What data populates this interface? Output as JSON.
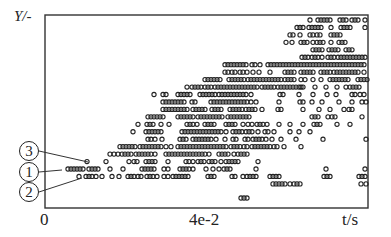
{
  "chart_data": {
    "type": "scatter",
    "title": "",
    "xlabel": "t/s",
    "ylabel": "Y/-",
    "x_ticks": [
      {
        "label": "0",
        "px": 45
      },
      {
        "label": "4e-2",
        "px": 205
      }
    ],
    "grid": false,
    "legend": [],
    "marker": "open-circle",
    "annotations": [
      {
        "label": "3",
        "symbol": "③",
        "cx": 29,
        "cy": 151,
        "to": [
          88,
          162
        ]
      },
      {
        "label": "1",
        "symbol": "①",
        "cx": 29,
        "cy": 172,
        "to": [
          62,
          170
        ]
      },
      {
        "label": "2",
        "symbol": "②",
        "cx": 29,
        "cy": 192,
        "to": [
          82,
          178
        ]
      }
    ],
    "frame": {
      "left": 45,
      "top": 15,
      "right": 368,
      "bottom": 208
    },
    "row_y0": 20,
    "row_dy": 7.45,
    "rows": [
      [
        310,
        318,
        321,
        324,
        327,
        330,
        340,
        343,
        346,
        352,
        355,
        358,
        365
      ],
      [
        297,
        300,
        303,
        309,
        312,
        315,
        318,
        321,
        331,
        341,
        344,
        347,
        350,
        365
      ],
      [
        290,
        293,
        300,
        310,
        313,
        317,
        320,
        331,
        334,
        337,
        340
      ],
      [
        286,
        292,
        301,
        304,
        307,
        313,
        317,
        320,
        323,
        331,
        339,
        342,
        345
      ],
      [
        313,
        316,
        319,
        322,
        329,
        332,
        335,
        338,
        346,
        349,
        352
      ],
      [
        302,
        305,
        308,
        312,
        315,
        318,
        322,
        328,
        331,
        334,
        338,
        341,
        344,
        347,
        350,
        353,
        356,
        359,
        362,
        365
      ],
      [
        225,
        228,
        231,
        234,
        237,
        240,
        243,
        246,
        252,
        255,
        260,
        268,
        271,
        274,
        277,
        280,
        283,
        286,
        289,
        292,
        295,
        298,
        301,
        304,
        307,
        310,
        313,
        316,
        319,
        322,
        325,
        328,
        331,
        334,
        337,
        340,
        343,
        346,
        349,
        352,
        355,
        358,
        361,
        364
      ],
      [
        225,
        228,
        232,
        235,
        240,
        243,
        247,
        253,
        259,
        270,
        285,
        288,
        291,
        294,
        301,
        304,
        307,
        310,
        313,
        321,
        324,
        327,
        330,
        334,
        337,
        340,
        343,
        346,
        349,
        352,
        355,
        358,
        364
      ],
      [
        205,
        208,
        211,
        214,
        217,
        220,
        229,
        232,
        235,
        238,
        241,
        244,
        248,
        251,
        254,
        257,
        260,
        263,
        266,
        269,
        272,
        275,
        278,
        281,
        285,
        288,
        291,
        294,
        301,
        305,
        313,
        321,
        330,
        333,
        336,
        339,
        342,
        345,
        348,
        358,
        361,
        364,
        367
      ],
      [
        187,
        192,
        195,
        198,
        201,
        205,
        208,
        211,
        215,
        218,
        221,
        224,
        227,
        230,
        233,
        236,
        239,
        242,
        245,
        248,
        251,
        254,
        257,
        262,
        265,
        268,
        271,
        274,
        278,
        281,
        284,
        287,
        290,
        293,
        296,
        299,
        301,
        303,
        315,
        326,
        337,
        346,
        350,
        353,
        356,
        359
      ],
      [
        154,
        163,
        166,
        178,
        181,
        184,
        187,
        190,
        200,
        203,
        206,
        209,
        212,
        215,
        219,
        222,
        225,
        228,
        231,
        234,
        237,
        240,
        243,
        246,
        251,
        280,
        283,
        299,
        313,
        327,
        336,
        352,
        355,
        360,
        364
      ],
      [
        163,
        166,
        169,
        172,
        175,
        178,
        181,
        184,
        192,
        195,
        211,
        214,
        217,
        220,
        223,
        226,
        229,
        232,
        235,
        238,
        241,
        244,
        247,
        251,
        256,
        279,
        300,
        303,
        312,
        322,
        339,
        352,
        362,
        366
      ],
      [
        163,
        166,
        169,
        172,
        175,
        178,
        181,
        184,
        187,
        193,
        196,
        199,
        202,
        205,
        212,
        215,
        218,
        221,
        230,
        233,
        236,
        239,
        242,
        246,
        249,
        252,
        255,
        262,
        278,
        281,
        303,
        319,
        330,
        344,
        349,
        352
      ],
      [
        148,
        151,
        154,
        157,
        160,
        163,
        178,
        181,
        184,
        187,
        190,
        193,
        198,
        201,
        204,
        207,
        210,
        213,
        216,
        219,
        222,
        228,
        231,
        234,
        237,
        240,
        243,
        246,
        249,
        312,
        315,
        318,
        328,
        332,
        335,
        362
      ],
      [
        138,
        147,
        150,
        153,
        161,
        169,
        187,
        190,
        193,
        197,
        205,
        208,
        211,
        214,
        226,
        229,
        232,
        235,
        243,
        248,
        252,
        257,
        260,
        263,
        267,
        279,
        290,
        303,
        314,
        317,
        320,
        337,
        350
      ],
      [
        133,
        146,
        149,
        152,
        155,
        158,
        161,
        182,
        185,
        188,
        191,
        194,
        197,
        200,
        203,
        206,
        209,
        212,
        215,
        218,
        221,
        226,
        233,
        236,
        239,
        242,
        246,
        249,
        252,
        258,
        265,
        268,
        274,
        290,
        299,
        310
      ],
      [
        148,
        151,
        155,
        162,
        180,
        183,
        186,
        193,
        196,
        199,
        202,
        205,
        208,
        211,
        216,
        225,
        233,
        236,
        245,
        248,
        253,
        256,
        259,
        262,
        266,
        272,
        281,
        296,
        323,
        366
      ],
      [
        120,
        123,
        126,
        129,
        132,
        135,
        140,
        143,
        146,
        149,
        152,
        155,
        158,
        161,
        166,
        171,
        178,
        181,
        184,
        187,
        190,
        193,
        196,
        199,
        202,
        205,
        208,
        211,
        214,
        217,
        220,
        223,
        226,
        231,
        234,
        237,
        240,
        244,
        247,
        252,
        255,
        258,
        261,
        264,
        267,
        270,
        274,
        277,
        284,
        301
      ],
      [
        110,
        114,
        118,
        122,
        125,
        128,
        131,
        136,
        139,
        142,
        145,
        148,
        151,
        155,
        166,
        169,
        172,
        175,
        178,
        181,
        184,
        187,
        190,
        193,
        196,
        199,
        202,
        205,
        209,
        219,
        222,
        225,
        228,
        234,
        238,
        241,
        244,
        247
      ],
      [
        87,
        106,
        129,
        134,
        137,
        146,
        149,
        152,
        155,
        168,
        186,
        189,
        193,
        198,
        201,
        204,
        209,
        212,
        215,
        221,
        226,
        229,
        232,
        235,
        238,
        258
      ],
      [
        68,
        71,
        74,
        77,
        80,
        83,
        89,
        92,
        95,
        98,
        110,
        123,
        142,
        145,
        148,
        151,
        154,
        164,
        168,
        180,
        183,
        186,
        189,
        193,
        206,
        213,
        219,
        224,
        227,
        230,
        256,
        326,
        365
      ],
      [
        79,
        86,
        89,
        92,
        96,
        102,
        112,
        119,
        128,
        131,
        134,
        138,
        141,
        147,
        150,
        153,
        157,
        164,
        168,
        173,
        176,
        179,
        182,
        185,
        188,
        208,
        211,
        214,
        232,
        235,
        243,
        247,
        250,
        253,
        256,
        270,
        273,
        276,
        279,
        324,
        327,
        330,
        359,
        362,
        365
      ],
      [
        273,
        276,
        279,
        282,
        285,
        290,
        294,
        297,
        300,
        361,
        366
      ]
    ],
    "outliers": [
      [
        241,
        198
      ],
      [
        244,
        198
      ],
      [
        247,
        198
      ]
    ]
  }
}
